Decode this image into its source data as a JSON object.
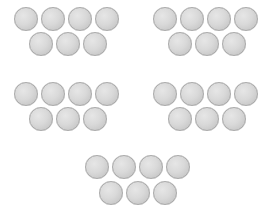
{
  "scene": {
    "background": "#ffffff",
    "coin_fill": "#d9d9d9",
    "coin_edge": "#a9a9a9",
    "coin_diameter_px": 24,
    "groups": [
      {
        "id": "top-left",
        "top_row_count": 4,
        "bottom_row_count": 3
      },
      {
        "id": "top-right",
        "top_row_count": 4,
        "bottom_row_count": 3
      },
      {
        "id": "middle-left",
        "top_row_count": 4,
        "bottom_row_count": 3
      },
      {
        "id": "middle-right",
        "top_row_count": 4,
        "bottom_row_count": 3
      },
      {
        "id": "bottom-center",
        "top_row_count": 4,
        "bottom_row_count": 3
      }
    ],
    "total_coins": 35
  }
}
